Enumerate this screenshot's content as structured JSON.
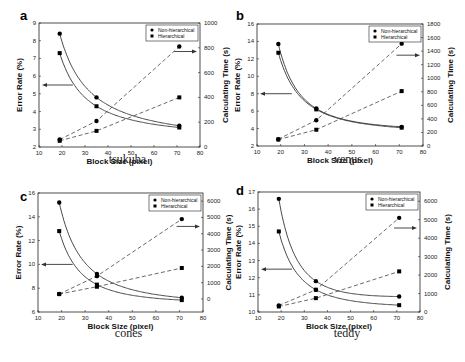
{
  "chart_data": [
    {
      "panel": "a",
      "caption": "tsukuba",
      "type": "line",
      "xlabel": "Block Size (pixel)",
      "ylabel": "Error Rate (%)",
      "y2label": "Calculating Time (s)",
      "xlim": [
        10,
        80
      ],
      "ylim": [
        2,
        9
      ],
      "y2lim": [
        0,
        1000
      ],
      "xticks": [
        10,
        20,
        30,
        40,
        50,
        60,
        70,
        80
      ],
      "yticks": [
        2,
        3,
        4,
        5,
        6,
        7,
        8,
        9
      ],
      "y2ticks": [
        0,
        200,
        400,
        600,
        800,
        1000
      ],
      "legend": [
        "Non-hierarchical",
        "Hierarchical"
      ],
      "x": [
        19,
        35,
        71
      ],
      "series": [
        {
          "name": "Non-hierarchical",
          "axis": "left",
          "metric": "Error Rate (%)",
          "style": "solid",
          "values": [
            8.4,
            4.8,
            3.2
          ]
        },
        {
          "name": "Hierarchical",
          "axis": "left",
          "metric": "Error Rate (%)",
          "style": "solid",
          "values": [
            7.3,
            4.3,
            3.1
          ]
        },
        {
          "name": "Non-hierarchical",
          "axis": "right",
          "metric": "Calculating Time (s)",
          "style": "dashed",
          "values": [
            60,
            210,
            810
          ]
        },
        {
          "name": "Hierarchical",
          "axis": "right",
          "metric": "Calculating Time (s)",
          "style": "dashed",
          "values": [
            50,
            130,
            400
          ]
        }
      ],
      "arrows": {
        "left_at_y": 5.5,
        "right_at_y2": 770
      }
    },
    {
      "panel": "b",
      "caption": "venus",
      "type": "line",
      "xlabel": "Block Size (pixel)",
      "ylabel": "Error Rate (%)",
      "y2label": "Calculating Time (s)",
      "xlim": [
        10,
        80
      ],
      "ylim": [
        2,
        16
      ],
      "y2lim": [
        0,
        1800
      ],
      "xticks": [
        10,
        20,
        30,
        40,
        50,
        60,
        70,
        80
      ],
      "yticks": [
        2,
        4,
        6,
        8,
        10,
        12,
        14,
        16
      ],
      "y2ticks": [
        0,
        200,
        400,
        600,
        800,
        1000,
        1200,
        1400,
        1600,
        1800
      ],
      "legend": [
        "Non-hierarchical",
        "Hierarchical"
      ],
      "x": [
        19,
        35,
        71
      ],
      "series": [
        {
          "name": "Non-hierarchical",
          "axis": "left",
          "metric": "Error Rate (%)",
          "style": "solid",
          "values": [
            13.7,
            6.3,
            4.2
          ]
        },
        {
          "name": "Hierarchical",
          "axis": "left",
          "metric": "Error Rate (%)",
          "style": "solid",
          "values": [
            12.7,
            6.2,
            4.1
          ]
        },
        {
          "name": "Non-hierarchical",
          "axis": "right",
          "metric": "Calculating Time (s)",
          "style": "dashed",
          "values": [
            100,
            380,
            1510
          ]
        },
        {
          "name": "Hierarchical",
          "axis": "right",
          "metric": "Calculating Time (s)",
          "style": "dashed",
          "values": [
            95,
            240,
            810
          ]
        }
      ],
      "arrows": {
        "left_at_y": 8,
        "right_at_y2": 1340
      }
    },
    {
      "panel": "c",
      "caption": "cones",
      "type": "line",
      "xlabel": "Block Size (pixel)",
      "ylabel": "Error Rate (%)",
      "y2label": "Calculating Time (s)",
      "xlim": [
        10,
        80
      ],
      "ylim": [
        6,
        16
      ],
      "y2lim": [
        -800,
        6500
      ],
      "xticks": [
        10,
        20,
        30,
        40,
        50,
        60,
        70,
        80
      ],
      "yticks": [
        6,
        8,
        10,
        12,
        14,
        16
      ],
      "y2ticks": [
        0,
        1000,
        2000,
        3000,
        4000,
        5000,
        6000
      ],
      "legend": [
        "Non-hierarchical",
        "Hierarchical"
      ],
      "x": [
        19,
        35,
        71
      ],
      "series": [
        {
          "name": "Non-hierarchical",
          "axis": "left",
          "metric": "Error Rate (%)",
          "style": "solid",
          "values": [
            15.2,
            9.2,
            7.2
          ]
        },
        {
          "name": "Hierarchical",
          "axis": "left",
          "metric": "Error Rate (%)",
          "style": "solid",
          "values": [
            12.8,
            8.3,
            7.0
          ]
        },
        {
          "name": "Non-hierarchical",
          "axis": "right",
          "metric": "Calculating Time (s)",
          "style": "dashed",
          "values": [
            300,
            1400,
            4900
          ]
        },
        {
          "name": "Hierarchical",
          "axis": "right",
          "metric": "Calculating Time (s)",
          "style": "dashed",
          "values": [
            300,
            750,
            1900
          ]
        }
      ],
      "arrows": {
        "left_at_y": 10,
        "right_at_y2": 4450
      }
    },
    {
      "panel": "d",
      "caption": "teddy",
      "type": "line",
      "xlabel": "Block Size (pixel)",
      "ylabel": "Error Rate (%)",
      "y2label": "Calculating Time (s)",
      "xlim": [
        10,
        80
      ],
      "ylim": [
        10,
        17
      ],
      "y2lim": [
        0,
        6500
      ],
      "xticks": [
        10,
        20,
        30,
        40,
        50,
        60,
        70,
        80
      ],
      "yticks": [
        10,
        11,
        12,
        13,
        14,
        15,
        16,
        17
      ],
      "y2ticks": [
        0,
        1000,
        2000,
        3000,
        4000,
        5000,
        6000
      ],
      "legend": [
        "Non-hierarchical",
        "Hierarchical"
      ],
      "x": [
        19,
        35,
        71
      ],
      "series": [
        {
          "name": "Non-hierarchical",
          "axis": "left",
          "metric": "Error Rate (%)",
          "style": "solid",
          "values": [
            16.6,
            11.8,
            10.9
          ]
        },
        {
          "name": "Hierarchical",
          "axis": "left",
          "metric": "Error Rate (%)",
          "style": "solid",
          "values": [
            14.7,
            11.3,
            10.4
          ]
        },
        {
          "name": "Non-hierarchical",
          "axis": "right",
          "metric": "Calculating Time (s)",
          "style": "dashed",
          "values": [
            350,
            1200,
            5100
          ]
        },
        {
          "name": "Hierarchical",
          "axis": "right",
          "metric": "Calculating Time (s)",
          "style": "dashed",
          "values": [
            300,
            750,
            2200
          ]
        }
      ],
      "arrows": {
        "left_at_y": 12.5,
        "right_at_y2": 4550
      }
    }
  ]
}
